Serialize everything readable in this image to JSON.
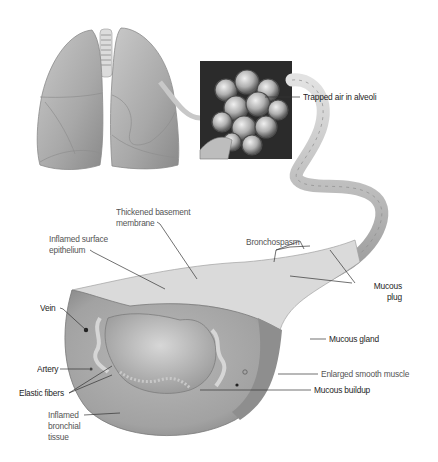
{
  "figure": {
    "panels": [
      "lungs",
      "alveoli-inset",
      "bronchus-cross-section"
    ]
  },
  "labels": {
    "trapped_air": "Trapped air in alveoli",
    "thickened_membrane": "Thickened basement\nmembrane",
    "inflamed_epithelium": "Inflamed surface\nepithelium",
    "bronchospasm": "Bronchospasm",
    "mucous_plug": "Mucous\nplug",
    "vein": "Vein",
    "mucous_gland": "Mucous gland",
    "artery": "Artery",
    "enlarged_muscle": "Enlarged smooth muscle",
    "elastic_fibers": "Elastic fibers",
    "mucous_buildup": "Mucous buildup",
    "inflamed_tissue": "Inflamed\nbronchial\ntissue"
  },
  "colors": {
    "background": "#ffffff",
    "illustration_tone": "#9a9a9a",
    "leader_line": "#333333",
    "label_text": "#3a3a3a"
  }
}
